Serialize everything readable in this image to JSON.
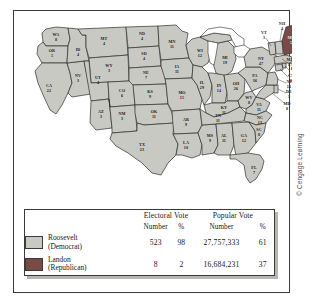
{
  "figure": {
    "credit": "© Cengage Learning"
  },
  "map": {
    "name": "1936-presidential-election-electoral-map",
    "colors": {
      "democrat_fill": "#c9c9c4",
      "republican_fill": "#7a4a46",
      "border": "#2e2e2c",
      "water": "#ffffff"
    },
    "states": [
      {
        "abbr": "WA",
        "votes": "8"
      },
      {
        "abbr": "OR",
        "votes": "5"
      },
      {
        "abbr": "CA",
        "votes": "22"
      },
      {
        "abbr": "NV",
        "votes": "3"
      },
      {
        "abbr": "ID",
        "votes": "4"
      },
      {
        "abbr": "MT",
        "votes": "4"
      },
      {
        "abbr": "WY",
        "votes": "3"
      },
      {
        "abbr": "UT",
        "votes": "4"
      },
      {
        "abbr": "AZ",
        "votes": "3"
      },
      {
        "abbr": "CO",
        "votes": "6"
      },
      {
        "abbr": "NM",
        "votes": "3"
      },
      {
        "abbr": "ND",
        "votes": "4"
      },
      {
        "abbr": "SD",
        "votes": "4"
      },
      {
        "abbr": "NE",
        "votes": "7"
      },
      {
        "abbr": "KS",
        "votes": "9"
      },
      {
        "abbr": "OK",
        "votes": "11"
      },
      {
        "abbr": "TX",
        "votes": "23"
      },
      {
        "abbr": "MN",
        "votes": "11"
      },
      {
        "abbr": "IA",
        "votes": "11"
      },
      {
        "abbr": "MO",
        "votes": "15"
      },
      {
        "abbr": "AR",
        "votes": "9"
      },
      {
        "abbr": "LA",
        "votes": "10"
      },
      {
        "abbr": "WI",
        "votes": "12"
      },
      {
        "abbr": "IL",
        "votes": "29"
      },
      {
        "abbr": "MS",
        "votes": "9"
      },
      {
        "abbr": "MI",
        "votes": "19"
      },
      {
        "abbr": "IN",
        "votes": "14"
      },
      {
        "abbr": "KY",
        "votes": "11"
      },
      {
        "abbr": "TN",
        "votes": "11"
      },
      {
        "abbr": "AL",
        "votes": "11"
      },
      {
        "abbr": "GA",
        "votes": "12"
      },
      {
        "abbr": "FL",
        "votes": "7"
      },
      {
        "abbr": "OH",
        "votes": "26"
      },
      {
        "abbr": "WV",
        "votes": "8"
      },
      {
        "abbr": "VA",
        "votes": "11"
      },
      {
        "abbr": "NC",
        "votes": "13"
      },
      {
        "abbr": "SC",
        "votes": "8"
      },
      {
        "abbr": "PA",
        "votes": "36"
      },
      {
        "abbr": "NY",
        "votes": "47"
      },
      {
        "abbr": "MD",
        "votes": "8"
      },
      {
        "abbr": "DE",
        "votes": "3"
      },
      {
        "abbr": "NJ",
        "votes": "16"
      },
      {
        "abbr": "CT",
        "votes": "8"
      },
      {
        "abbr": "RI",
        "votes": "4"
      },
      {
        "abbr": "MA",
        "votes": "17"
      },
      {
        "abbr": "VT",
        "votes": "3"
      },
      {
        "abbr": "NH",
        "votes": "4"
      },
      {
        "abbr": "ME",
        "votes": "5",
        "party": "republican"
      }
    ]
  },
  "legend": {
    "groups": {
      "electoral": "Electoral Vote",
      "popular": "Popular Vote"
    },
    "subheaders": {
      "electoral_number": "Number",
      "electoral_pct": "%",
      "popular_number": "Number",
      "popular_pct": "%"
    },
    "rows": [
      {
        "candidate": "Roosevelt",
        "party": "(Democrat)",
        "electoral_number": "523",
        "electoral_pct": "98",
        "popular_number": "27,757,333",
        "popular_pct": "61"
      },
      {
        "candidate": "Landon",
        "party": "(Republican)",
        "electoral_number": "8",
        "electoral_pct": "2",
        "popular_number": "16,684,231",
        "popular_pct": "37"
      }
    ]
  }
}
